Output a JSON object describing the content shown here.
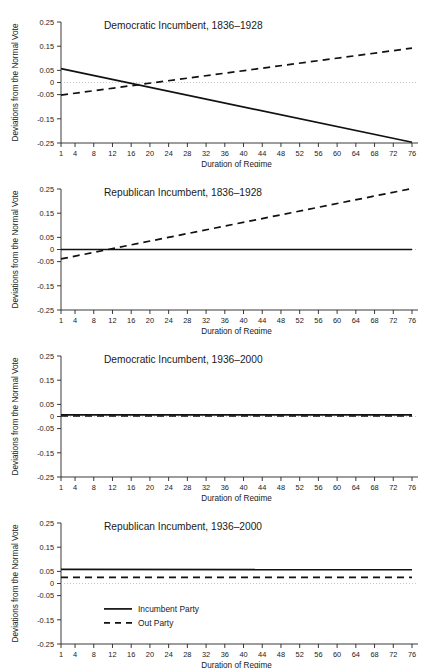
{
  "figure": {
    "panel_count": 4,
    "xlabel": "Duration of Regime",
    "ylabel": "Deviations from the Normal Vote",
    "legend": {
      "incumbent_label": "Incumbent Party",
      "out_label": "Out Party"
    }
  },
  "chart_data": [
    {
      "type": "line",
      "title": "Democratic Incumbent, 1836–1928",
      "xlabel": "Duration of Regime",
      "ylabel": "Deviations from the Normal Vote",
      "xlim": [
        1,
        76
      ],
      "ylim": [
        -0.25,
        0.25
      ],
      "xticks": [
        1,
        4,
        8,
        12,
        16,
        20,
        24,
        28,
        32,
        36,
        40,
        44,
        48,
        52,
        56,
        60,
        64,
        68,
        72,
        76
      ],
      "yticks": [
        0.25,
        0.15,
        0.05,
        0,
        -0.05,
        -0.15,
        -0.25
      ],
      "ytick_labels": [
        "0.25",
        "0.15",
        "0.05",
        "0",
        "-0.05",
        "-0.15",
        "-0.25"
      ],
      "grid": false,
      "zero_reference_line": 0,
      "legend_position": "none",
      "series": [
        {
          "name": "Incumbent Party",
          "style": "solid",
          "x": [
            1,
            76
          ],
          "values": [
            0.057,
            -0.247
          ]
        },
        {
          "name": "Out Party",
          "style": "dashed",
          "x": [
            1,
            76
          ],
          "values": [
            -0.052,
            0.142
          ]
        }
      ]
    },
    {
      "type": "line",
      "title": "Republican Incumbent, 1836–1928",
      "xlabel": "Duration of Regime",
      "ylabel": "Deviations from the Normal Vote",
      "xlim": [
        1,
        76
      ],
      "ylim": [
        -0.25,
        0.25
      ],
      "xticks": [
        1,
        4,
        8,
        12,
        16,
        20,
        24,
        28,
        32,
        36,
        40,
        44,
        48,
        52,
        56,
        60,
        64,
        68,
        72,
        76
      ],
      "yticks": [
        0.25,
        0.15,
        0.05,
        0,
        -0.05,
        -0.15,
        -0.25
      ],
      "ytick_labels": [
        "0.25",
        "0.15",
        "0.05",
        "0",
        "-0.05",
        "-0.15",
        "-0.25"
      ],
      "grid": false,
      "zero_reference_line": 0,
      "legend_position": "none",
      "series": [
        {
          "name": "Incumbent Party",
          "style": "solid",
          "x": [
            1,
            76
          ],
          "values": [
            0.0,
            0.0
          ]
        },
        {
          "name": "Out Party",
          "style": "dashed",
          "x": [
            1,
            76
          ],
          "values": [
            -0.039,
            0.252
          ]
        }
      ]
    },
    {
      "type": "line",
      "title": "Democratic Incumbent, 1936–2000",
      "xlabel": "Duration of Regime",
      "ylabel": "Deviations from the Normal Vote",
      "xlim": [
        1,
        76
      ],
      "ylim": [
        -0.25,
        0.25
      ],
      "xticks": [
        1,
        4,
        8,
        12,
        16,
        20,
        24,
        28,
        32,
        36,
        40,
        44,
        48,
        52,
        56,
        60,
        64,
        68,
        72,
        76
      ],
      "yticks": [
        0.25,
        0.15,
        0.05,
        0,
        -0.05,
        -0.15,
        -0.25
      ],
      "ytick_labels": [
        "0.25",
        "0.15",
        "0.05",
        "0",
        "-0.05",
        "-0.15",
        "-0.25"
      ],
      "grid": false,
      "zero_reference_line": 0,
      "legend_position": "none",
      "series": [
        {
          "name": "Incumbent Party",
          "style": "solid",
          "x": [
            1,
            76
          ],
          "values": [
            0.007,
            0.007
          ]
        },
        {
          "name": "Out Party",
          "style": "dashed",
          "x": [
            1,
            76
          ],
          "values": [
            0.002,
            0.002
          ]
        }
      ]
    },
    {
      "type": "line",
      "title": "Republican Incumbent, 1936–2000",
      "xlabel": "Duration of Regime",
      "ylabel": "Deviations from the Normal Vote",
      "xlim": [
        1,
        76
      ],
      "ylim": [
        -0.25,
        0.25
      ],
      "xticks": [
        1,
        4,
        8,
        12,
        16,
        20,
        24,
        28,
        32,
        36,
        40,
        44,
        48,
        52,
        56,
        60,
        64,
        68,
        72,
        76
      ],
      "yticks": [
        0.25,
        0.15,
        0.05,
        0,
        -0.05,
        -0.15,
        -0.25
      ],
      "ytick_labels": [
        "0.25",
        "0.15",
        "0.05",
        "0",
        "-0.05",
        "-0.15",
        "-0.25"
      ],
      "grid": false,
      "zero_reference_line": 0,
      "legend_position": "inside-lower-left",
      "legend_entries": [
        "Incumbent Party",
        "Out Party"
      ],
      "series": [
        {
          "name": "Incumbent Party",
          "style": "solid",
          "x": [
            1,
            76
          ],
          "values": [
            0.058,
            0.057
          ]
        },
        {
          "name": "Out Party",
          "style": "dashed",
          "x": [
            1,
            76
          ],
          "values": [
            0.025,
            0.025
          ]
        }
      ]
    }
  ]
}
